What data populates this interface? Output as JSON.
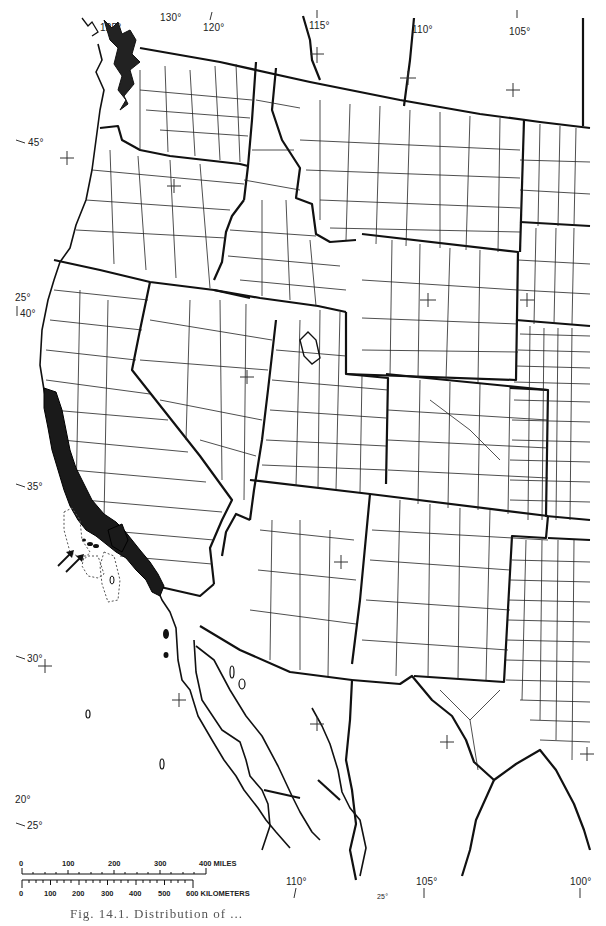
{
  "map": {
    "subject": "Western United States and northwestern Mexico with county boundaries",
    "colors": {
      "ink": "#111111",
      "paper": "#ffffff",
      "range_fill": "#1a1a1a"
    },
    "longitude_labels": [
      {
        "text": "125°",
        "x": 100,
        "y": 28
      },
      {
        "text": "130°",
        "x": 163,
        "y": 16
      },
      {
        "text": "120°",
        "x": 205,
        "y": 28
      },
      {
        "text": "115°",
        "x": 310,
        "y": 26
      },
      {
        "text": "110°",
        "x": 414,
        "y": 30
      },
      {
        "text": "105°",
        "x": 511,
        "y": 32
      },
      {
        "text": "110°",
        "x": 288,
        "y": 884
      },
      {
        "text": "105°",
        "x": 421,
        "y": 884
      },
      {
        "text": "100°",
        "x": 572,
        "y": 884
      },
      {
        "text": "25°",
        "x": 378,
        "y": 896
      }
    ],
    "latitude_labels": [
      {
        "text": "45°",
        "x": 28,
        "y": 143
      },
      {
        "text": "25°",
        "x": 16,
        "y": 297
      },
      {
        "text": "40°",
        "x": 20,
        "y": 313
      },
      {
        "text": "35°",
        "x": 27,
        "y": 487
      },
      {
        "text": "30°",
        "x": 27,
        "y": 659
      },
      {
        "text": "20°",
        "x": 15,
        "y": 800
      },
      {
        "text": "25°",
        "x": 27,
        "y": 826
      }
    ],
    "range_annotation": {
      "arrows": 2,
      "note": "Shaded distribution along California coast ranges and Channel Islands (islands indicated by arrows and dotted outlines)"
    },
    "scale_bar": {
      "miles": {
        "ticks": [
          "0",
          "100",
          "200",
          "300",
          "400 MILES"
        ]
      },
      "kilometers": {
        "ticks": [
          "0",
          "100",
          "200",
          "300",
          "400",
          "500",
          "600 KILOMETERS"
        ]
      }
    },
    "caption": "Fig. 14.1. Distribution of ..."
  }
}
